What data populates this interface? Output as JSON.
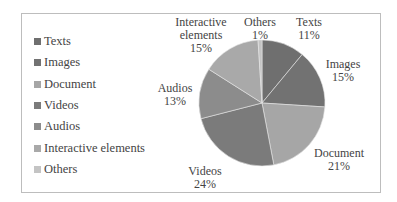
{
  "chart_data": {
    "type": "pie",
    "title": "",
    "legend_position": "left",
    "categories": [
      "Texts",
      "Images",
      "Document",
      "Videos",
      "Audios",
      "Interactive elements",
      "Others"
    ],
    "values": [
      11,
      15,
      21,
      24,
      13,
      15,
      1
    ],
    "unit": "%",
    "colors": [
      "#6f6f6f",
      "#727272",
      "#a6a6a6",
      "#7b7b7b",
      "#8c8c8c",
      "#a9a9a9",
      "#c4c4c4"
    ],
    "data_labels": [
      {
        "name": "Texts",
        "pct": "11%"
      },
      {
        "name": "Images",
        "pct": "15%"
      },
      {
        "name": "Document",
        "pct": "21%"
      },
      {
        "name": "Videos",
        "pct": "24%"
      },
      {
        "name": "Audios",
        "pct": "13%"
      },
      {
        "name_line1": "Interactive",
        "name_line2": "elements",
        "pct": "15%"
      },
      {
        "name": "Others",
        "pct": "1%"
      }
    ]
  },
  "legend": {
    "items": [
      {
        "label": "Texts",
        "color": "#6f6f6f"
      },
      {
        "label": "Images",
        "color": "#727272"
      },
      {
        "label": "Document",
        "color": "#a6a6a6"
      },
      {
        "label": "Videos",
        "color": "#7b7b7b"
      },
      {
        "label": "Audios",
        "color": "#8c8c8c"
      },
      {
        "label": "Interactive elements",
        "color": "#a9a9a9"
      },
      {
        "label": "Others",
        "color": "#c4c4c4"
      }
    ]
  }
}
